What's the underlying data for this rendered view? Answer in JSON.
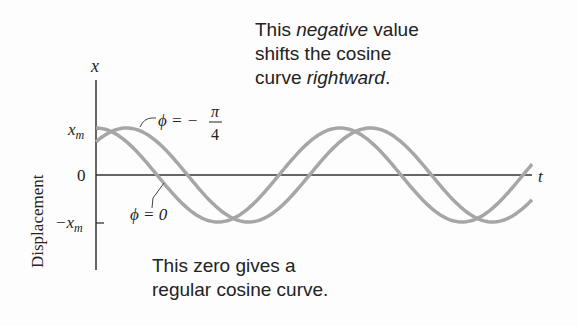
{
  "chart_data": {
    "type": "line",
    "title": "",
    "xlabel": "t",
    "ylabel": "Displacement",
    "y_axis_symbol": "x",
    "y_ticks": [
      "x_m",
      "0",
      "-x_m"
    ],
    "ylim": [
      -1.5,
      1.5
    ],
    "series": [
      {
        "name": "φ = 0",
        "function": "x_m cos(ωt)",
        "color": "#a8a8a8"
      },
      {
        "name": "φ = -π/4",
        "function": "x_m cos(ωt - π/4)",
        "color": "#a8a8a8"
      }
    ],
    "annotations": [
      "This negative value shifts the cosine curve rightward.",
      "This zero gives a regular cosine curve."
    ]
  },
  "labels": {
    "y_axis": "x",
    "t_axis": "t",
    "ylabel": "Displacement",
    "tick_xm": "x",
    "tick_xm_sub": "m",
    "tick_zero": "0",
    "tick_neg": "−x",
    "tick_neg_sub": "m",
    "phi_shift": "ϕ = −",
    "phi_shift_num": "π",
    "phi_shift_den": "4",
    "phi_zero": "ϕ = 0"
  },
  "notes": {
    "top": {
      "w1": "This ",
      "w2": "negative",
      "w3": " value",
      "l2": "shifts the cosine",
      "l3a": "curve ",
      "l3b": "rightward",
      "l3c": "."
    },
    "bottom": {
      "l1": "This zero gives a",
      "l2": "regular cosine curve."
    }
  }
}
